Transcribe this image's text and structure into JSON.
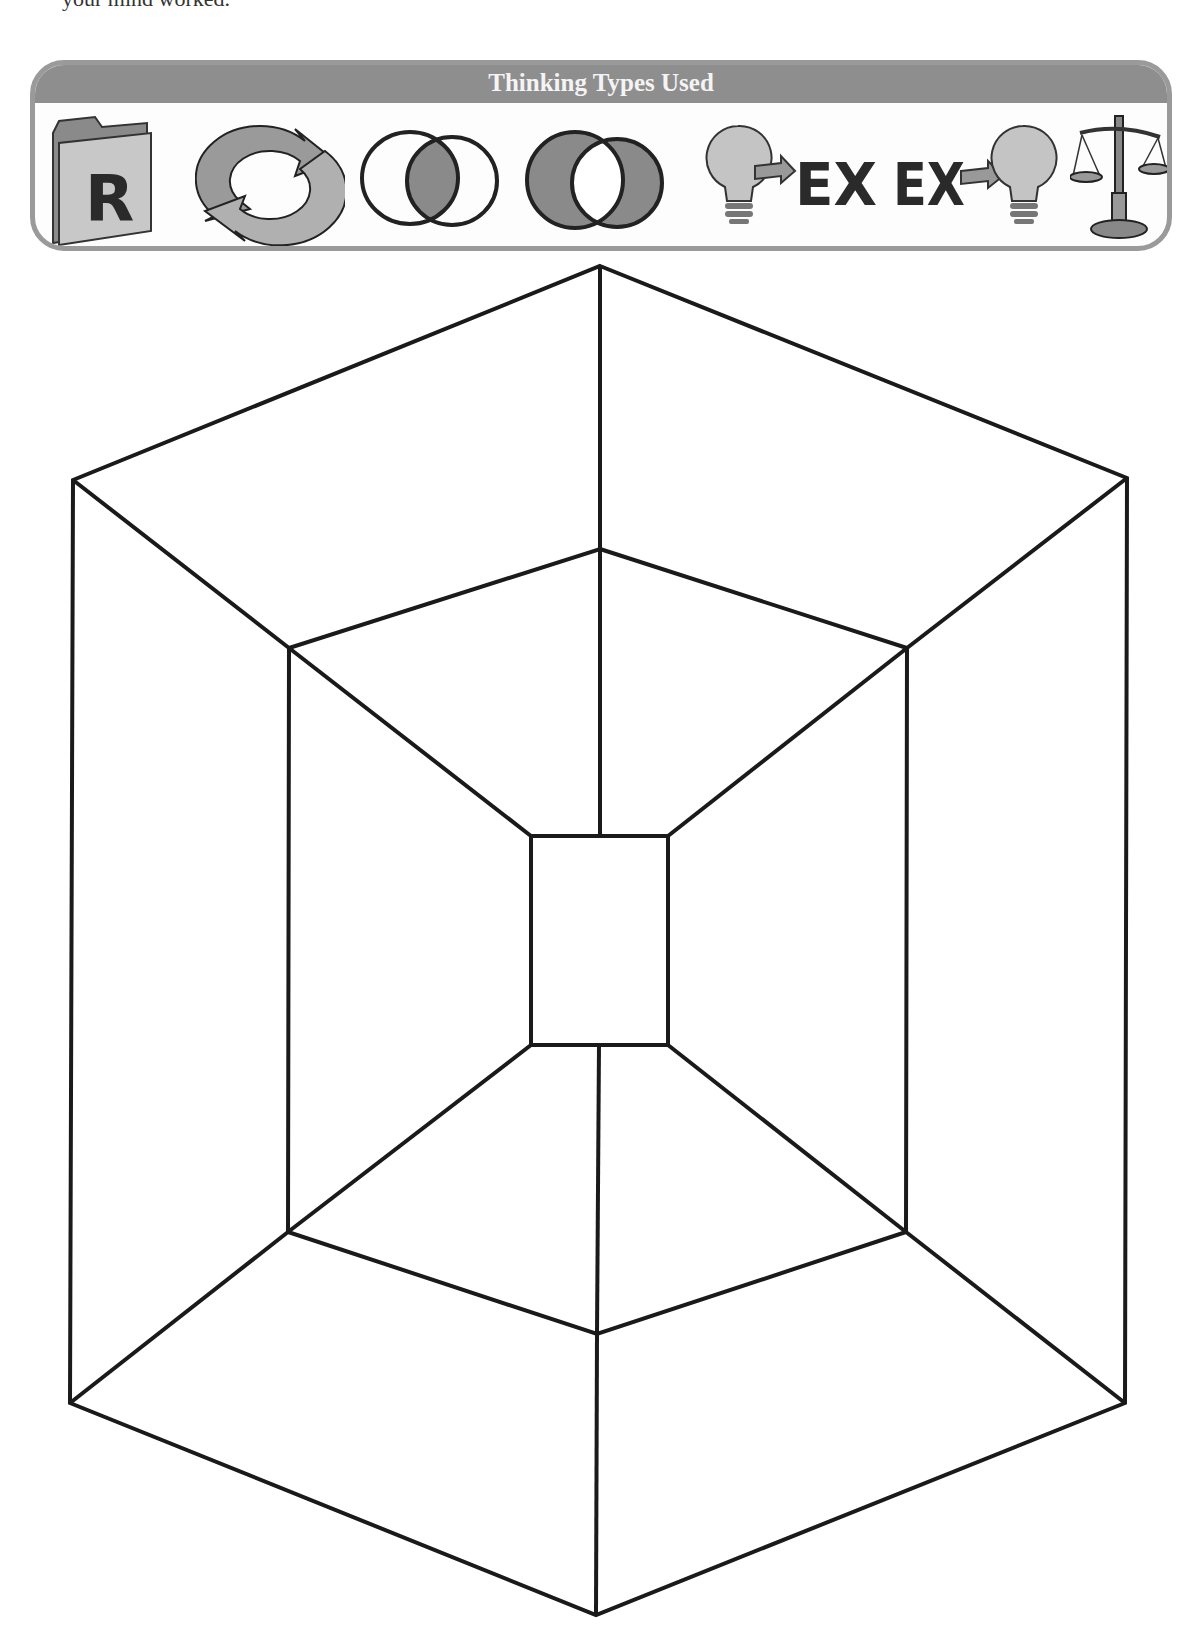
{
  "intro": {
    "text": "your mind worked."
  },
  "banner": {
    "title": "Thinking Types Used",
    "icons": [
      {
        "name": "folder-r-icon",
        "label": "R",
        "meaning": "Recall"
      },
      {
        "name": "refresh-cycle-icon",
        "meaning": "Cycle / Sequence"
      },
      {
        "name": "venn-intersection-icon",
        "meaning": "Compare (similarities)"
      },
      {
        "name": "venn-difference-icon",
        "meaning": "Contrast (differences)"
      },
      {
        "name": "bulb-to-example-icon",
        "label": "EX",
        "meaning": "Idea to Example"
      },
      {
        "name": "example-to-bulb-icon",
        "label": "EX",
        "meaning": "Example to Idea"
      },
      {
        "name": "balance-scale-icon",
        "meaning": "Evaluate"
      }
    ]
  },
  "diagram": {
    "type": "nested hexagon graphic organizer with center rectangle",
    "outer_hexagon": [
      [
        600,
        266
      ],
      [
        1127,
        478
      ],
      [
        1125,
        1403
      ],
      [
        596,
        1615
      ],
      [
        70,
        1403
      ],
      [
        73,
        480
      ]
    ],
    "inner_hexagon": [
      [
        600,
        549
      ],
      [
        907,
        648
      ],
      [
        906,
        1232
      ],
      [
        597,
        1334
      ],
      [
        288,
        1232
      ],
      [
        289,
        648
      ]
    ],
    "center_rect": {
      "x": 531,
      "y": 836,
      "width": 137,
      "height": 209
    },
    "stroke_color": "#1a1a1a",
    "sections": 6
  }
}
